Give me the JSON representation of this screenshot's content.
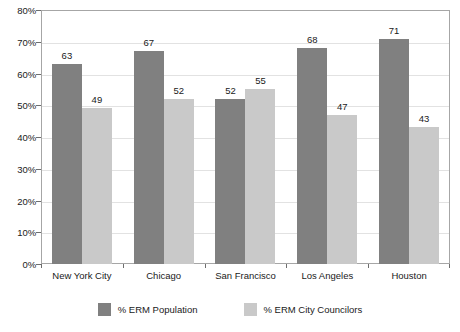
{
  "chart_data": {
    "type": "bar",
    "title": "",
    "subtitle": "",
    "xlabel": "",
    "ylabel": "",
    "ylim": [
      0,
      80
    ],
    "ytick_step": 10,
    "ytick_labels": [
      "0%",
      "10%",
      "20%",
      "30%",
      "40%",
      "50%",
      "60%",
      "70%",
      "80%"
    ],
    "ytick_values": [
      0,
      10,
      20,
      30,
      40,
      50,
      60,
      70,
      80
    ],
    "grid": true,
    "legend_position": "bottom",
    "categories": [
      "New York City",
      "Chicago",
      "San Francisco",
      "Los Angeles",
      "Houston"
    ],
    "series": [
      {
        "name": "% ERM Population",
        "color": "#808080",
        "values": [
          63,
          67,
          52,
          68,
          71
        ]
      },
      {
        "name": "% ERM City Councilors",
        "color": "#c9c9c9",
        "values": [
          49,
          52,
          55,
          47,
          43
        ]
      }
    ]
  },
  "colors": {
    "series_population": "#808080",
    "series_councilors": "#c9c9c9",
    "frame": "#a6a6a6",
    "gridline": "#e2e2e2",
    "text": "#1a1a1a",
    "background": "#ffffff"
  }
}
